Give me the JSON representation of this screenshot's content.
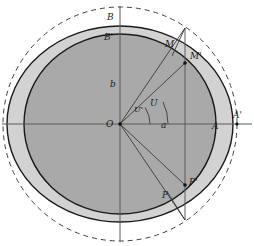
{
  "figure": {
    "kind": "geometric-diagram",
    "width": 254,
    "height": 246,
    "background_color": "#ffffff"
  },
  "colors": {
    "stroke": "#1a1a1a",
    "inner_fill": "#a8a8a8",
    "outer_fill": "#d0d0d0",
    "dashed_stroke": "#4a4a4a",
    "thin_stroke": "#555555",
    "axis_stroke": "#555555",
    "label_color": "#1a1a1a"
  },
  "geometry": {
    "center": {
      "x": 120,
      "y": 124,
      "label": "O"
    },
    "dashed_circle": {
      "cx": 120,
      "cy": 124,
      "r": 117,
      "dash": "5 4"
    },
    "outer_ellipse": {
      "cx": 120,
      "cy": 124,
      "rx": 113,
      "ry": 98
    },
    "inner_ellipse": {
      "cx": 120,
      "cy": 124,
      "rx": 96,
      "ry": 90
    },
    "axes": {
      "horizontal": {
        "x1": 3,
        "y1": 124,
        "x2": 251,
        "y2": 124
      },
      "vertical": {
        "x1": 120,
        "y1": 7,
        "x2": 120,
        "y2": 241
      }
    },
    "vertical_chord": {
      "x": 185,
      "y_top": 29,
      "y_bottom": 219
    },
    "points": {
      "A": {
        "x": 216,
        "y": 124
      },
      "Ap": {
        "x": 237,
        "y": 124
      },
      "B": {
        "x": 120,
        "y": 26
      },
      "Bp": {
        "x": 120,
        "y": 34
      },
      "M": {
        "x": 172,
        "y": 56
      },
      "Mp": {
        "x": 185,
        "y": 63
      },
      "Mtop": {
        "x": 185,
        "y": 29
      },
      "P": {
        "x": 168,
        "y": 193
      },
      "Pp": {
        "x": 185,
        "y": 185
      },
      "Pbot": {
        "x": 185,
        "y": 219
      }
    },
    "rays_from_center": [
      {
        "to": "Mtop"
      },
      {
        "to": "Mp"
      },
      {
        "to": "Pp"
      },
      {
        "to": "P"
      }
    ],
    "angle_arcs": [
      {
        "name": "U-prime",
        "radius": 30,
        "from_deg": 0,
        "to_deg": 33
      },
      {
        "name": "U",
        "radius": 48,
        "from_deg": 0,
        "to_deg": 21
      }
    ]
  },
  "labels": {
    "origin": {
      "text": "O",
      "x": 108,
      "y": 125
    },
    "semi_major": {
      "text": "a",
      "x": 163,
      "y": 126
    },
    "semi_minor": {
      "text": "b",
      "x": 112,
      "y": 85
    },
    "vertex_A": {
      "text": "A",
      "x": 214,
      "y": 127
    },
    "vertex_A_prime": {
      "text": "A'",
      "x": 235,
      "y": 116
    },
    "vertex_B": {
      "text": "B",
      "x": 108,
      "y": 18
    },
    "vertex_B_prime": {
      "text": "B'",
      "x": 106,
      "y": 38
    },
    "point_M": {
      "text": "M",
      "x": 167,
      "y": 45
    },
    "point_M_prime": {
      "text": "M'",
      "x": 192,
      "y": 57
    },
    "point_P": {
      "text": "P",
      "x": 164,
      "y": 196
    },
    "point_P_prime": {
      "text": "P'",
      "x": 191,
      "y": 183
    },
    "angle_U": {
      "text": "U",
      "x": 152,
      "y": 104
    },
    "angle_U_prime": {
      "text": "U'",
      "x": 135,
      "y": 110
    }
  }
}
